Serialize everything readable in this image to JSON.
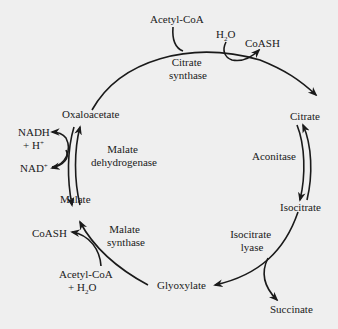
{
  "diagram": {
    "background": "#efefef",
    "ink_color": "#1a1a1a",
    "metabolites": {
      "acetyl_coa_top": "Acetyl-CoA",
      "h2o_top": "H",
      "h2o_top_sub": "2",
      "h2o_top_tail": "O",
      "coash_top": "CoASH",
      "citrate": "Citrate",
      "isocitrate": "Isocitrate",
      "succinate": "Succinate",
      "glyoxylate": "Glyoxylate",
      "malate": "Malate",
      "oxaloacetate": "Oxaloacetate",
      "nadh": "NADH",
      "h_plus": "+ H",
      "h_plus_sup": "+",
      "nad": "NAD",
      "nad_sup": "+",
      "coash_bottom": "CoASH",
      "acetyl_coa_bottom": "Acetyl-CoA",
      "h2o_bottom_prefix": "+ H",
      "h2o_bottom_sub": "2",
      "h2o_bottom_tail": "O"
    },
    "enzymes": {
      "citrate_synthase_1": "Citrate",
      "citrate_synthase_2": "synthase",
      "aconitase": "Aconitase",
      "isocitrate_lyase_1": "Isocitrate",
      "isocitrate_lyase_2": "lyase",
      "malate_synthase_1": "Malate",
      "malate_synthase_2": "synthase",
      "malate_dehydrogenase_1": "Malate",
      "malate_dehydrogenase_2": "dehydrogenase"
    }
  }
}
